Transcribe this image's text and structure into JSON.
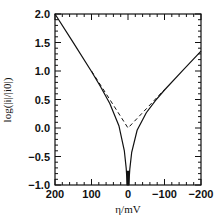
{
  "chart_data": {
    "type": "line",
    "title": "",
    "xlabel": "η/mV",
    "ylabel": "log(|i|/|i0|)",
    "xlim": [
      200,
      -200
    ],
    "ylim": [
      -1.0,
      2.0
    ],
    "x_reversed": true,
    "grid": false,
    "legend": null,
    "xticks": [
      200,
      100,
      0,
      -100,
      -200
    ],
    "xtick_labels": [
      "200",
      "100",
      "0",
      "−100",
      "−200"
    ],
    "yticks": [
      2.0,
      1.5,
      1.0,
      0.5,
      0.0,
      -0.5,
      -1.0
    ],
    "ytick_labels": [
      "2.0",
      "1.5",
      "1.0",
      "0.5",
      "0.0",
      "−0.5",
      "−1.0"
    ],
    "series": [
      {
        "name": "net current (solid)",
        "style": "solid",
        "x": [
          200,
          150,
          100,
          75,
          50,
          25,
          10,
          5,
          2,
          0.5,
          0,
          -0.5,
          -2,
          -5,
          -10,
          -25,
          -50,
          -75,
          -100,
          -150,
          -200
        ],
        "y": [
          2.0,
          1.499,
          0.991,
          0.725,
          0.432,
          0.041,
          -0.395,
          -0.706,
          -1.0,
          -1.0,
          -1.0,
          -1.0,
          -1.0,
          -0.721,
          -0.427,
          -0.04,
          0.269,
          0.481,
          0.666,
          1.012,
          1.35
        ]
      },
      {
        "name": "Tafel asymptotes (dashed)",
        "style": "dashed",
        "x": [
          100,
          50,
          0,
          -50,
          -100
        ],
        "y": [
          1.0,
          0.5,
          0.0,
          0.3375,
          0.675
        ]
      }
    ]
  }
}
